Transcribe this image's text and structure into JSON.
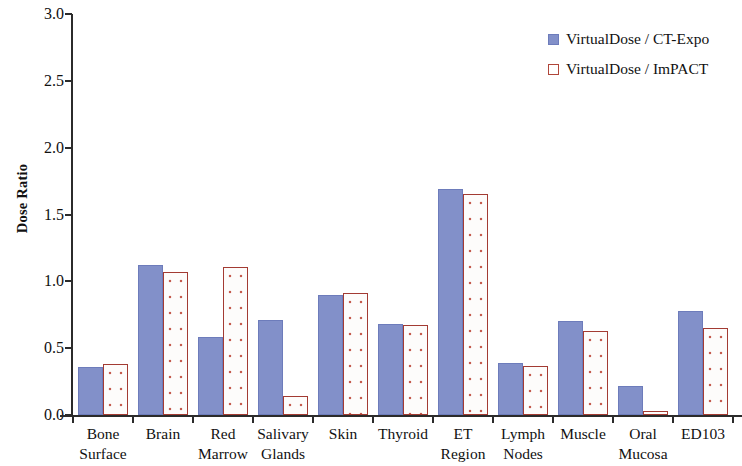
{
  "chart_data": {
    "type": "bar",
    "title": "",
    "xlabel": "",
    "ylabel": "Dose Ratio",
    "ylim": [
      0,
      3.0
    ],
    "ytick_labels": [
      "0.0",
      "0.5",
      "1.0",
      "1.5",
      "2.0",
      "2.5",
      "3.0"
    ],
    "ytick_values": [
      0.0,
      0.5,
      1.0,
      1.5,
      2.0,
      2.5,
      3.0
    ],
    "grid": false,
    "legend_position": "top-right",
    "categories": [
      "Bone Surface",
      "Brain",
      "Red Marrow",
      "Salivary Glands",
      "Skin",
      "Thyroid",
      "ET Region",
      "Lymph Nodes",
      "Muscle",
      "Oral Mucosa",
      "ED103"
    ],
    "category_lines": [
      [
        "Bone",
        "Surface"
      ],
      [
        "Brain",
        ""
      ],
      [
        "Red",
        "Marrow"
      ],
      [
        "Salivary",
        "Glands"
      ],
      [
        "Skin",
        ""
      ],
      [
        "Thyroid",
        ""
      ],
      [
        "ET",
        "Region"
      ],
      [
        "Lymph",
        "Nodes"
      ],
      [
        "Muscle",
        ""
      ],
      [
        "Oral",
        "Mucosa"
      ],
      [
        "ED103",
        ""
      ]
    ],
    "series": [
      {
        "name": "VirtualDose / CT-Expo",
        "color": "#8290c9",
        "values": [
          0.36,
          1.12,
          0.58,
          0.71,
          0.9,
          0.68,
          1.69,
          0.39,
          0.7,
          0.22,
          0.78
        ]
      },
      {
        "name": "VirtualDose / ImPACT",
        "color": "#a33b33",
        "values": [
          0.38,
          1.07,
          1.11,
          0.14,
          0.91,
          0.67,
          1.65,
          0.37,
          0.63,
          0.03,
          0.65
        ]
      }
    ]
  },
  "legend": {
    "items": [
      {
        "label": "VirtualDose / CT-Expo",
        "marker": "filled-square-blue"
      },
      {
        "label": "VirtualDose / ImPACT",
        "marker": "open-square-red"
      }
    ]
  },
  "axis": {
    "y_title": "Dose Ratio"
  },
  "colors": {
    "series_a": "#8290c9",
    "series_a_border": "#6d7cbb",
    "series_b_fill": "#fdfcfb",
    "series_b_border": "#a33b33",
    "series_b_dots": "#c45b4e",
    "axis": "#2b2b2b",
    "text": "#111111",
    "background": "#ffffff"
  }
}
